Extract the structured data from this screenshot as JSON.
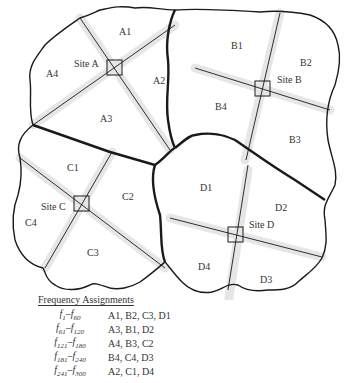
{
  "diagram": {
    "sites": [
      {
        "name": "Site A",
        "cells": [
          "A1",
          "A2",
          "A3",
          "A4"
        ]
      },
      {
        "name": "Site B",
        "cells": [
          "B1",
          "B2",
          "B3",
          "B4"
        ]
      },
      {
        "name": "Site C",
        "cells": [
          "C1",
          "C2",
          "C3",
          "C4"
        ]
      },
      {
        "name": "Site D",
        "cells": [
          "D1",
          "D2",
          "D3",
          "D4"
        ]
      }
    ],
    "labels": {
      "site_a": "Site A",
      "site_b": "Site B",
      "site_c": "Site C",
      "site_d": "Site D",
      "a1": "A1",
      "a2": "A2",
      "a3": "A3",
      "a4": "A4",
      "b1": "B1",
      "b2": "B2",
      "b3": "B3",
      "b4": "B4",
      "c1": "C1",
      "c2": "C2",
      "c3": "C3",
      "c4": "C4",
      "d1": "D1",
      "d2": "D2",
      "d3": "D3",
      "d4": "D4"
    }
  },
  "legend": {
    "title": "Frequency Assignments",
    "rows": [
      {
        "from": "1",
        "to": "60",
        "sites": "A1, B2, C3, D1"
      },
      {
        "from": "61",
        "to": "120",
        "sites": "A3, B1, D2"
      },
      {
        "from": "121",
        "to": "180",
        "sites": "A4, B3, C2"
      },
      {
        "from": "181",
        "to": "240",
        "sites": "B4, C4, D3"
      },
      {
        "from": "241",
        "to": "300",
        "sites": "A2, C1, D4"
      }
    ]
  }
}
